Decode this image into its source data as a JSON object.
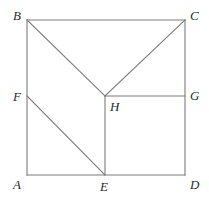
{
  "figure": {
    "canvas": {
      "width": 209,
      "height": 198
    },
    "background_color": "#ffffff",
    "line_color": "#7c7c7c",
    "label_color": "#2b2b2b",
    "label_style": "italic-serif",
    "vertices": {
      "A": {
        "label": "A",
        "x": 27,
        "y": 175,
        "label_x": 13,
        "label_y": 178
      },
      "B": {
        "label": "B",
        "x": 27,
        "y": 20,
        "label_x": 13,
        "label_y": 9
      },
      "C": {
        "label": "C",
        "x": 185,
        "y": 20,
        "label_x": 190,
        "label_y": 9
      },
      "D": {
        "label": "D",
        "x": 185,
        "y": 175,
        "label_x": 190,
        "label_y": 178
      },
      "E": {
        "label": "E",
        "x": 105,
        "y": 175,
        "label_x": 100,
        "label_y": 180
      },
      "F": {
        "label": "F",
        "x": 27,
        "y": 96,
        "label_x": 13,
        "label_y": 90
      },
      "G": {
        "label": "G",
        "x": 185,
        "y": 96,
        "label_x": 190,
        "label_y": 89
      },
      "H": {
        "label": "H",
        "x": 105,
        "y": 96,
        "label_x": 110,
        "label_y": 100
      }
    },
    "segments": [
      {
        "name": "side-AB",
        "from": "A",
        "to": "B",
        "path": "M 27 175 L 27 20"
      },
      {
        "name": "side-BC",
        "from": "B",
        "to": "C",
        "path": "M 27 20 L 185 20"
      },
      {
        "name": "side-CD",
        "from": "C",
        "to": "D",
        "path": "M 185 20 L 185 175"
      },
      {
        "name": "side-DA",
        "from": "D",
        "to": "A",
        "path": "M 185 175 L 27 175"
      },
      {
        "name": "diagonal-BH",
        "from": "B",
        "to": "H",
        "path": "M 27 20 L 105 96"
      },
      {
        "name": "diagonal-HC",
        "from": "H",
        "to": "C",
        "path": "M 105 96 L 185 20"
      },
      {
        "name": "diagonal-FE",
        "from": "F",
        "to": "E",
        "path": "M 27 96 L 105 175"
      },
      {
        "name": "segment-HG",
        "from": "H",
        "to": "G",
        "path": "M 105 96 L 185 96"
      },
      {
        "name": "segment-HE",
        "from": "H",
        "to": "E",
        "path": "M 105 96 L 105 175"
      }
    ]
  }
}
